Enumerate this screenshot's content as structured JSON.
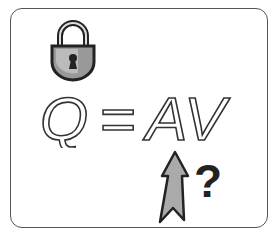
{
  "illustration": {
    "equation": {
      "left": "Q",
      "operator": "=",
      "right": "AV"
    },
    "question_mark": "?",
    "icons": [
      "lock-icon",
      "arrow-up-icon"
    ],
    "colors": {
      "outline": "#222222",
      "fill_gray": "#aaaaaa",
      "frame": "#555555"
    }
  }
}
